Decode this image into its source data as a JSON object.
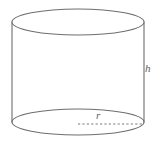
{
  "figure": {
    "name": "cylinder-diagram",
    "kind": "3d-solid-geometry-figure",
    "shape": "cylinder",
    "background_color": "#ffffff",
    "stroke_color": "#6e6e6e",
    "label_color": "#5f5f5f",
    "stroke_width": 1.1
  },
  "labels": {
    "height": "h",
    "radius": "r"
  },
  "geometry": {
    "top_ellipse": {
      "cx": 78,
      "cy": 22,
      "rx": 66,
      "ry": 13
    },
    "bottom_ellipse": {
      "cx": 78,
      "cy": 122,
      "rx": 66,
      "ry": 13
    },
    "left_side": {
      "x": 12,
      "y1": 22,
      "y2": 122
    },
    "right_side": {
      "x": 144,
      "y1": 22,
      "y2": 122
    },
    "radius_line": {
      "x1": 78,
      "y1": 124,
      "x2": 143,
      "y2": 124,
      "style": "dashed"
    }
  }
}
